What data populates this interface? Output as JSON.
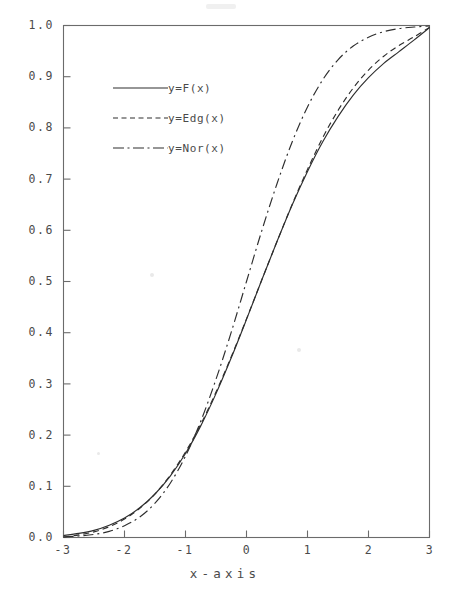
{
  "figure": {
    "background_color": "#ffffff",
    "ink_color": "#2e2e2e",
    "axis_color": "#6b6b6b"
  },
  "axes": {
    "x_title": "x-axis",
    "y_title": "",
    "x_ticks": [
      "-3",
      "-2",
      "-1",
      "0",
      "1",
      "2",
      "3"
    ],
    "y_ticks": [
      "0.0",
      "0.1",
      "0.2",
      "0.3",
      "0.4",
      "0.5",
      "0.6",
      "0.7",
      "0.8",
      "0.9",
      "1.0"
    ]
  },
  "legend": {
    "entries": [
      {
        "label": "y=F(x)",
        "style": "solid"
      },
      {
        "label": "y=Edg(x)",
        "style": "dashed"
      },
      {
        "label": "y=Nor(x)",
        "style": "dashdot"
      }
    ]
  },
  "chart_data": {
    "type": "line",
    "title": "",
    "subtitle": "",
    "xlabel": "x-axis",
    "ylabel": "",
    "xlim": [
      -3,
      3
    ],
    "ylim": [
      0.0,
      1.0
    ],
    "xticks": [
      -3,
      -2,
      -1,
      0,
      1,
      2,
      3
    ],
    "yticks": [
      0.0,
      0.1,
      0.2,
      0.3,
      0.4,
      0.5,
      0.6,
      0.7,
      0.8,
      0.9,
      1.0
    ],
    "grid": false,
    "legend_position": "upper-left-inside",
    "x": [
      -3.0,
      -2.75,
      -2.5,
      -2.25,
      -2.0,
      -1.75,
      -1.5,
      -1.25,
      -1.0,
      -0.75,
      -0.5,
      -0.25,
      0.0,
      0.25,
      0.5,
      0.75,
      1.0,
      1.25,
      1.5,
      1.75,
      2.0,
      2.25,
      2.5,
      2.75,
      3.0
    ],
    "series": [
      {
        "name": "y=F(x)",
        "style": "solid",
        "values": [
          0.004,
          0.008,
          0.014,
          0.024,
          0.038,
          0.058,
          0.085,
          0.12,
          0.164,
          0.218,
          0.281,
          0.351,
          0.426,
          0.503,
          0.578,
          0.65,
          0.715,
          0.773,
          0.822,
          0.864,
          0.898,
          0.926,
          0.949,
          0.972,
          0.996
        ]
      },
      {
        "name": "y=Edg(x)",
        "style": "dashed",
        "values": [
          0.001,
          0.005,
          0.011,
          0.021,
          0.036,
          0.057,
          0.085,
          0.122,
          0.167,
          0.221,
          0.284,
          0.353,
          0.427,
          0.503,
          0.578,
          0.651,
          0.719,
          0.781,
          0.834,
          0.878,
          0.913,
          0.94,
          0.961,
          0.978,
          0.996
        ]
      },
      {
        "name": "y=Nor(x)",
        "style": "dashdot",
        "values": [
          0.001,
          0.003,
          0.006,
          0.012,
          0.023,
          0.04,
          0.067,
          0.106,
          0.159,
          0.227,
          0.309,
          0.401,
          0.5,
          0.599,
          0.691,
          0.773,
          0.841,
          0.894,
          0.933,
          0.96,
          0.977,
          0.988,
          0.994,
          0.997,
          0.999
        ]
      }
    ]
  }
}
